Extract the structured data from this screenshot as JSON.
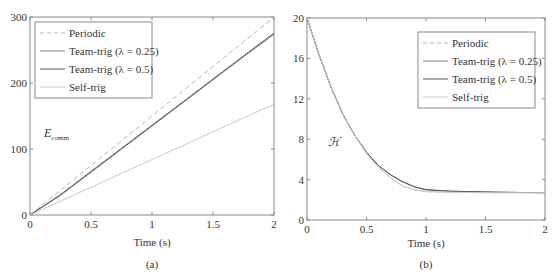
{
  "chart_data": [
    {
      "type": "line",
      "panel": "(a)",
      "title": "",
      "xlabel": "Time (s)",
      "ylabel": "E_comm",
      "xlim": [
        0,
        2
      ],
      "ylim": [
        0,
        300
      ],
      "xticks": [
        "0",
        "0.5",
        "1",
        "1.5",
        "2"
      ],
      "yticks": [
        "0",
        "100",
        "200",
        "300"
      ],
      "grid": false,
      "legend_position": "upper left",
      "x": [
        0,
        0.25,
        0.5,
        0.75,
        1.0,
        1.25,
        1.5,
        1.75,
        2.0
      ],
      "series": [
        {
          "name": "Periodic",
          "style": "dashed",
          "values": [
            0,
            37.5,
            75,
            112.5,
            150,
            187.5,
            225,
            262.5,
            300
          ]
        },
        {
          "name": "Team-trig (λ = 0.25)",
          "style": "solid",
          "values": [
            0,
            31,
            66,
            101,
            136,
            171,
            206,
            241,
            276
          ]
        },
        {
          "name": "Team-trig (λ = 0.5)",
          "style": "solid",
          "values": [
            0,
            30,
            65,
            100,
            135,
            170,
            205,
            240,
            274
          ]
        },
        {
          "name": "Self-trig",
          "style": "solid-light",
          "values": [
            0,
            21,
            42,
            63,
            84,
            105,
            126,
            147,
            168
          ]
        }
      ]
    },
    {
      "type": "line",
      "panel": "(b)",
      "title": "",
      "xlabel": "Time (s)",
      "ylabel": "H",
      "xlim": [
        0,
        2
      ],
      "ylim": [
        0,
        20
      ],
      "xticks": [
        "0",
        "0.5",
        "1",
        "1.5",
        "2"
      ],
      "yticks": [
        "0",
        "4",
        "8",
        "12",
        "16",
        "20"
      ],
      "grid": false,
      "legend_position": "upper right",
      "x": [
        0,
        0.1,
        0.2,
        0.3,
        0.4,
        0.5,
        0.6,
        0.7,
        0.8,
        0.9,
        1.0,
        1.2,
        1.4,
        1.6,
        1.8,
        2.0
      ],
      "series": [
        {
          "name": "Periodic",
          "style": "dashed",
          "values": [
            20,
            16.4,
            13.2,
            10.5,
            8.4,
            6.6,
            5.2,
            4.2,
            3.4,
            3.0,
            2.8,
            2.75,
            2.72,
            2.7,
            2.7,
            2.7
          ]
        },
        {
          "name": "Team-trig (λ = 0.25)",
          "style": "solid",
          "values": [
            20,
            16.4,
            13.2,
            10.5,
            8.4,
            6.7,
            5.4,
            4.5,
            3.8,
            3.3,
            3.0,
            2.85,
            2.8,
            2.75,
            2.72,
            2.7
          ]
        },
        {
          "name": "Team-trig (λ = 0.5)",
          "style": "solid",
          "values": [
            20,
            16.4,
            13.2,
            10.5,
            8.4,
            6.7,
            5.4,
            4.5,
            3.8,
            3.3,
            3.0,
            2.85,
            2.8,
            2.75,
            2.72,
            2.7
          ]
        },
        {
          "name": "Self-trig",
          "style": "solid-light",
          "values": [
            20,
            16.4,
            13.2,
            10.5,
            8.4,
            6.6,
            5.2,
            4.2,
            3.4,
            3.0,
            2.8,
            2.75,
            2.72,
            2.7,
            2.7,
            2.7
          ]
        }
      ]
    }
  ],
  "panels": {
    "a": {
      "caption": "(a)",
      "xlabel": "Time (s)",
      "ylabel_main": "E",
      "ylabel_sub": "comm",
      "xticks": [
        "0",
        "0.5",
        "1",
        "1.5",
        "2"
      ],
      "yticks": [
        "0",
        "100",
        "200",
        "300"
      ],
      "legend": [
        "Periodic",
        "Team-trig (λ = 0.25)",
        "Team-trig (λ = 0.5)",
        "Self-trig"
      ]
    },
    "b": {
      "caption": "(b)",
      "xlabel": "Time (s)",
      "ylabel": "ℋ",
      "xticks": [
        "0",
        "0.5",
        "1",
        "1.5",
        "2"
      ],
      "yticks": [
        "0",
        "4",
        "8",
        "12",
        "16",
        "20"
      ],
      "legend": [
        "Periodic",
        "Team-trig (λ = 0.25)",
        "Team-trig (λ = 0.5)",
        "Self-trig"
      ]
    }
  },
  "colors": {
    "axis": "#8a8a8a",
    "periodic": "#b5b5b5",
    "team_025": "#7a7a7a",
    "team_05": "#555555",
    "self_trig": "#c8c8c8",
    "text": "#333333"
  }
}
